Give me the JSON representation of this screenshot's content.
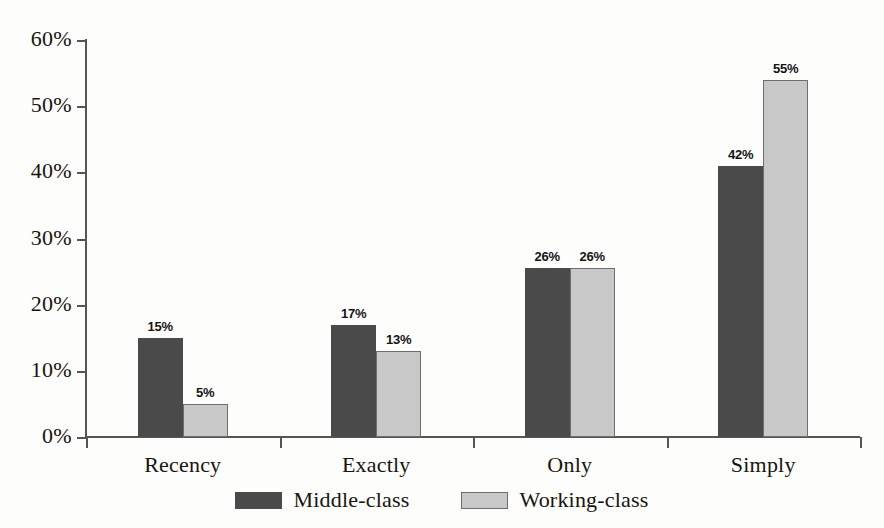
{
  "chart_data": {
    "type": "bar",
    "title": "",
    "subtitle": "",
    "xlabel": "",
    "ylabel": "",
    "categories": [
      "Recency",
      "Exactly",
      "Only",
      "Simply"
    ],
    "series": [
      {
        "name": "Middle-class",
        "color": "#4a4a4a",
        "values": [
          15,
          17,
          26,
          42
        ],
        "labels": [
          "15%",
          "17%",
          "26%",
          "42%"
        ],
        "plotted": [
          15.0,
          17.0,
          25.5,
          41.0
        ]
      },
      {
        "name": "Working-class",
        "color": "#c8c8c8",
        "values": [
          5,
          13,
          26,
          55
        ],
        "labels": [
          "5%",
          "13%",
          "26%",
          "55%"
        ],
        "plotted": [
          5.0,
          13.0,
          25.5,
          54.0
        ]
      }
    ],
    "ylim": [
      0,
      60
    ],
    "ytick_values": [
      0,
      10,
      20,
      30,
      40,
      50,
      60
    ],
    "ytick_labels": [
      "0%",
      "10%",
      "20%",
      "30%",
      "40%",
      "50%",
      "60%"
    ],
    "ytick_interval": 10,
    "grid": false,
    "legend_position": "bottom-center",
    "background_color": "#fdfdfb",
    "axis_color": "#555555"
  },
  "legend": {
    "items": [
      {
        "label": "Middle-class",
        "swatch": "legend-swatch-middle-class"
      },
      {
        "label": "Working-class",
        "swatch": "legend-swatch-working-class"
      }
    ]
  }
}
